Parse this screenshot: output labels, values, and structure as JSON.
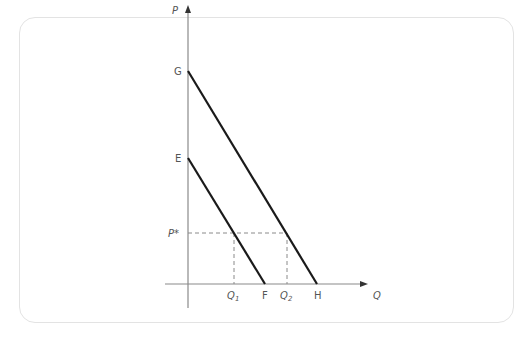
{
  "diagram": {
    "type": "supply-demand-shift",
    "axes": {
      "y_label": "P",
      "x_label": "Q"
    },
    "points": {
      "G": "G",
      "E": "E",
      "F": "F",
      "H": "H",
      "P_star": "P*",
      "Q1_main": "Q",
      "Q1_sub": "1",
      "Q2_main": "Q",
      "Q2_sub": "2"
    },
    "lines": [
      {
        "name": "demand-EF",
        "from": "E",
        "to": "F"
      },
      {
        "name": "demand-GH",
        "from": "G",
        "to": "H"
      }
    ],
    "colors": {
      "axis": "#8a8a8a",
      "curve": "#1a1a1a",
      "guide": "#8a8a8a",
      "frame": "#e3e3e3"
    }
  }
}
